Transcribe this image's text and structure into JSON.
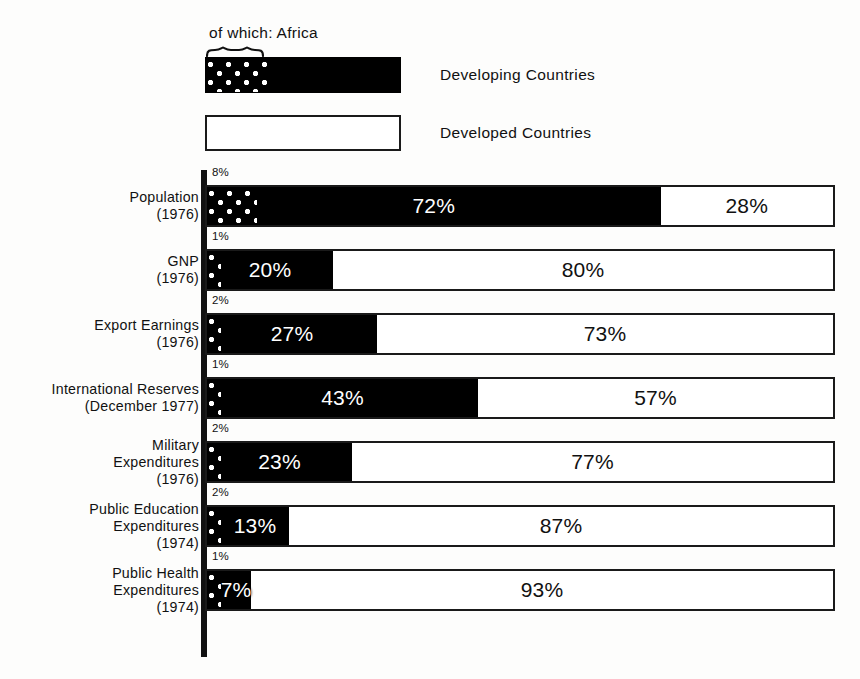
{
  "legend": {
    "africa_caption": "of which: Africa",
    "items": [
      {
        "label": "Developing Countries",
        "swatch": "black-with-africa-dots",
        "color": "#000000"
      },
      {
        "label": "Developed Countries",
        "swatch": "white-outlined",
        "color": "#ffffff"
      }
    ]
  },
  "chart_data": {
    "type": "bar",
    "orientation": "horizontal",
    "stacked": true,
    "title": "",
    "subtitle": "",
    "xlabel": "",
    "ylabel": "",
    "xlim": [
      0,
      100
    ],
    "grid": false,
    "legend_position": "top-left",
    "units": "percent",
    "categories": [
      "Population (1976)",
      "GNP (1976)",
      "Export Earnings (1976)",
      "International Reserves (December 1977)",
      "Military Expenditures (1976)",
      "Public Education Expenditures (1974)",
      "Public Health Expenditures (1974)"
    ],
    "series": [
      {
        "name": "Developing Countries",
        "values": [
          72,
          20,
          27,
          43,
          23,
          13,
          7
        ]
      },
      {
        "name": "Developed Countries",
        "values": [
          28,
          80,
          73,
          57,
          77,
          87,
          93
        ]
      },
      {
        "name": "of which: Africa",
        "values": [
          8,
          1,
          2,
          1,
          2,
          2,
          1
        ]
      }
    ]
  },
  "rows": [
    {
      "label_lines": [
        "Population"
      ],
      "year": "(1976)",
      "africa_pct": "8%",
      "africa_value": 8,
      "developing_label": "72%",
      "developing_value": 72,
      "developed_label": "28%",
      "developed_value": 28
    },
    {
      "label_lines": [
        "GNP"
      ],
      "year": "(1976)",
      "africa_pct": "1%",
      "africa_value": 1,
      "developing_label": "20%",
      "developing_value": 20,
      "developed_label": "80%",
      "developed_value": 80
    },
    {
      "label_lines": [
        "Export Earnings"
      ],
      "year": "(1976)",
      "africa_pct": "2%",
      "africa_value": 2,
      "developing_label": "27%",
      "developing_value": 27,
      "developed_label": "73%",
      "developed_value": 73
    },
    {
      "label_lines": [
        "International Reserves"
      ],
      "year": "(December 1977)",
      "africa_pct": "1%",
      "africa_value": 1,
      "developing_label": "43%",
      "developing_value": 43,
      "developed_label": "57%",
      "developed_value": 57
    },
    {
      "label_lines": [
        "Military",
        "Expenditures"
      ],
      "year": "(1976)",
      "africa_pct": "2%",
      "africa_value": 2,
      "developing_label": "23%",
      "developing_value": 23,
      "developed_label": "77%",
      "developed_value": 77
    },
    {
      "label_lines": [
        "Public Education",
        "Expenditures"
      ],
      "year": "(1974)",
      "africa_pct": "2%",
      "africa_value": 2,
      "developing_label": "13%",
      "developing_value": 13,
      "developed_label": "87%",
      "developed_value": 87
    },
    {
      "label_lines": [
        "Public Health",
        "Expenditures"
      ],
      "year": "(1974)",
      "africa_pct": "1%",
      "africa_value": 1,
      "developing_label": "7%",
      "developing_value": 7,
      "developed_label": "93%",
      "developed_value": 93
    }
  ],
  "colors": {
    "developing": "#000000",
    "developed": "#ffffff",
    "outline": "#1a1a1a",
    "axis": "#111111",
    "background": "#fdfdfc"
  }
}
